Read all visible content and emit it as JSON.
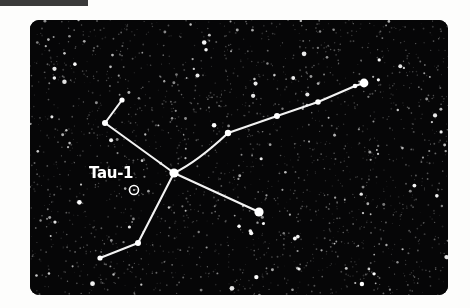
{
  "page": {
    "background_color": "#fdfdfc",
    "header_fragment": {
      "color": "#3a3a3a",
      "x": 0,
      "y": 0,
      "width": 88,
      "height": 6
    }
  },
  "sky_panel": {
    "background_color": "#060607",
    "corner_radius": 9,
    "x": 30,
    "y": 20,
    "width": 418,
    "height": 275,
    "star_color": "#ffffff",
    "line_color": "#f2f2f2"
  },
  "labels": [
    {
      "name": "tau-1",
      "text": "Tau-1",
      "color": "#ffffff",
      "x": 89,
      "y": 164
    }
  ],
  "chart_data": {
    "type": "scatter",
    "title": "Tau-1",
    "xlabel": "",
    "ylabel": "",
    "xlim": [
      0,
      418
    ],
    "ylim": [
      0,
      275
    ],
    "grid": false,
    "legend": null,
    "annotations": [
      {
        "text": "Tau-1",
        "x": 104,
        "y": 170,
        "marker": "open-circle"
      }
    ],
    "markers": [
      {
        "name": "tau-1-marker",
        "type": "open-circle",
        "x": 104,
        "y": 170,
        "radius": 4.5
      }
    ],
    "series": [
      {
        "name": "constellation-stars",
        "points": [
          {
            "id": "hub",
            "x": 144,
            "y": 153,
            "r": 4.6
          },
          {
            "id": "upper-left-outer",
            "x": 92,
            "y": 80,
            "r": 2.6
          },
          {
            "id": "upper-left-bend",
            "x": 75,
            "y": 103,
            "r": 3.0
          },
          {
            "id": "chain-1",
            "x": 198,
            "y": 113,
            "r": 3.2
          },
          {
            "id": "chain-2",
            "x": 247,
            "y": 96,
            "r": 3.0
          },
          {
            "id": "chain-3",
            "x": 288,
            "y": 82,
            "r": 2.8
          },
          {
            "id": "chain-4",
            "x": 325,
            "y": 66,
            "r": 2.3
          },
          {
            "id": "chain-end",
            "x": 334,
            "y": 63,
            "r": 4.4
          },
          {
            "id": "lower-right-end",
            "x": 229,
            "y": 192,
            "r": 4.6
          },
          {
            "id": "lower-left-bend",
            "x": 108,
            "y": 223,
            "r": 3.0
          },
          {
            "id": "lower-left-end",
            "x": 70,
            "y": 238,
            "r": 2.6
          }
        ]
      }
    ],
    "edges": [
      {
        "from": "upper-left-outer",
        "to": "upper-left-bend"
      },
      {
        "from": "upper-left-bend",
        "to": "hub"
      },
      {
        "from": "hub",
        "to": "chain-1",
        "curved": true
      },
      {
        "from": "chain-1",
        "to": "chain-2"
      },
      {
        "from": "chain-2",
        "to": "chain-3"
      },
      {
        "from": "chain-3",
        "to": "chain-4"
      },
      {
        "from": "chain-4",
        "to": "chain-end"
      },
      {
        "from": "hub",
        "to": "lower-right-end"
      },
      {
        "from": "hub",
        "to": "lower-left-bend"
      },
      {
        "from": "lower-left-bend",
        "to": "lower-left-end"
      }
    ]
  }
}
